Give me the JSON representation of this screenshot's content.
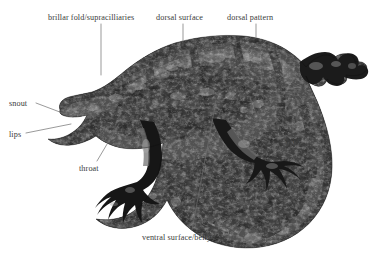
{
  "figure": {
    "background_color": "#ffffff",
    "label_color": "#3a3a3a",
    "leader_color": "#6f6f6f",
    "specimen_dark": "#1a1a1a",
    "specimen_mid": "#5c5c5c",
    "specimen_light": "#b9b9b9"
  },
  "labels": [
    {
      "id": "brillar-fold",
      "text": "brillar fold/supracilliaries",
      "x": 48,
      "y": 13,
      "leader": [
        [
          101,
          24
        ],
        [
          101,
          75
        ]
      ]
    },
    {
      "id": "dorsal-surface",
      "text": "dorsal surface",
      "x": 156,
      "y": 13,
      "leader": [
        [
          183,
          24
        ],
        [
          183,
          46
        ]
      ]
    },
    {
      "id": "dorsal-pattern",
      "text": "dorsal pattern",
      "x": 227,
      "y": 13,
      "leader": [
        [
          256,
          24
        ],
        [
          256,
          38
        ]
      ]
    },
    {
      "id": "snout",
      "text": "snout",
      "x": 9,
      "y": 99,
      "leader": [
        [
          36,
          103
        ],
        [
          73,
          117
        ]
      ]
    },
    {
      "id": "lips",
      "text": "lips",
      "x": 9,
      "y": 130,
      "leader": [
        [
          26,
          133
        ],
        [
          71,
          124
        ]
      ]
    },
    {
      "id": "throat",
      "text": "throat",
      "x": 79,
      "y": 164,
      "leader": [
        [
          97,
          161
        ],
        [
          119,
          124
        ]
      ]
    },
    {
      "id": "vent",
      "text": "vent",
      "x": 285,
      "y": 136,
      "leader": [
        [
          293,
          133
        ],
        [
          293,
          116
        ]
      ]
    },
    {
      "id": "ventral-surface",
      "text": "ventral surface/belly",
      "x": 142,
      "y": 233,
      "leader": [
        [
          192,
          230
        ],
        [
          216,
          101
        ]
      ]
    }
  ]
}
